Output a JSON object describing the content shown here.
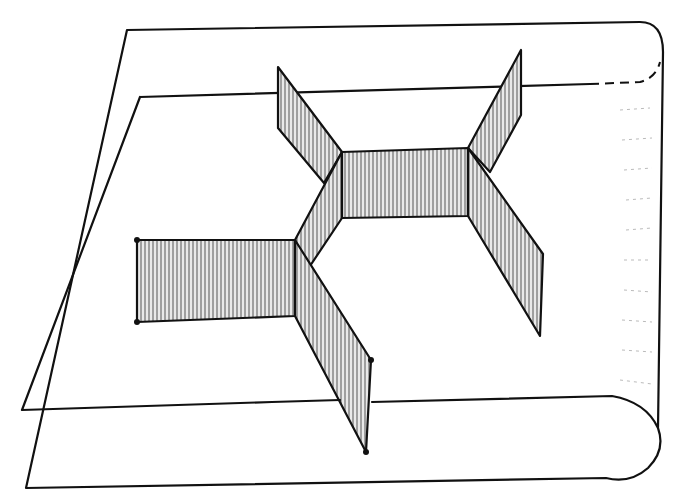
{
  "diagram": {
    "title": "Three-way junction of vertical walls standing on a curled sheet",
    "colors": {
      "line": "#111111",
      "hatch": "#555555",
      "background": "#ffffff"
    },
    "elements": {
      "sheet_outer": "outer sheet outline with rounded right edge",
      "sheet_inner": "inner plane outline with dashed hidden edge",
      "central_panel": "horizontal hatched panel between the two junctions",
      "left_panel": "hatched panel extending left",
      "upper_left_panel": "hatched diagonal panel going up-left",
      "lower_left_panel": "hatched diagonal panel going down-right from left junction",
      "upper_right_panel": "hatched diagonal panel going up-right",
      "lower_right_panel": "hatched diagonal panel going down-right",
      "connector_panel": "short diagonal panel connecting the two junctions"
    }
  }
}
